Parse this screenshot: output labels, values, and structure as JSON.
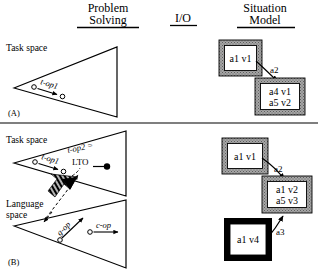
{
  "figure": {
    "divider_y": 123
  },
  "headers": [
    {
      "line1": "Problem",
      "line2": "Solving",
      "x": 108,
      "y": 12
    },
    {
      "line1": "I/O",
      "line2": "",
      "x": 183,
      "y": 22
    },
    {
      "line1": "Situation",
      "line2": "Model",
      "x": 265,
      "y": 12
    }
  ],
  "panels": [
    {
      "id": "A",
      "label": "(A)",
      "x": 8,
      "y": 113
    },
    {
      "id": "B",
      "label": "(B)",
      "x": 8,
      "y": 262
    }
  ],
  "space_labels": [
    {
      "text": "Task space",
      "x": 6,
      "y": 48,
      "panel": "A"
    },
    {
      "text": "Task space",
      "x": 6,
      "y": 140,
      "panel": "B"
    },
    {
      "text": "Language",
      "x": 6,
      "y": 204,
      "panel": "B"
    },
    {
      "text": "space",
      "x": 6,
      "y": 215,
      "panel": "B"
    }
  ],
  "operators": [
    {
      "id": "t-op1-a",
      "text": "t-op1",
      "panel": "A",
      "style": "italic-rotated"
    },
    {
      "id": "t-op1-b",
      "text": "t-op1",
      "panel": "B",
      "style": "italic-rotated"
    },
    {
      "id": "t-op2",
      "text": "t-op2 =",
      "panel": "B",
      "style": "italic-rotated"
    },
    {
      "id": "lto",
      "text": "LTO",
      "panel": "B",
      "style": "upright"
    },
    {
      "id": "g-op",
      "text": "g-op",
      "panel": "B",
      "style": "italic-rotated"
    },
    {
      "id": "c-op",
      "text": "c-op",
      "panel": "B",
      "style": "italic"
    }
  ],
  "situation_model": {
    "panel_A": {
      "nodes": [
        {
          "id": "nA1",
          "lines": [
            "a1 v1"
          ],
          "border": "gray",
          "x": 219,
          "y": 40,
          "w": 43,
          "h": 36
        },
        {
          "id": "nA2",
          "lines": [
            "a4 v1",
            "a5 v2"
          ],
          "border": "gray",
          "x": 255,
          "y": 78,
          "w": 50,
          "h": 37
        }
      ],
      "arcs": [
        {
          "id": "arcA2",
          "label": "a2",
          "from": "nA1",
          "to": "nA2",
          "lx": 270,
          "ly": 73
        }
      ]
    },
    "panel_B": {
      "nodes": [
        {
          "id": "nB1",
          "lines": [
            "a1 v1"
          ],
          "border": "gray",
          "x": 222,
          "y": 138,
          "w": 46,
          "h": 36
        },
        {
          "id": "nB2",
          "lines": [
            "a1 v2",
            "a5 v3"
          ],
          "border": "gray",
          "x": 262,
          "y": 176,
          "w": 50,
          "h": 37
        },
        {
          "id": "nB3",
          "lines": [
            "a1 v4"
          ],
          "border": "black",
          "x": 224,
          "y": 218,
          "w": 48,
          "h": 43
        }
      ],
      "arcs": [
        {
          "id": "arcB2",
          "label": "a2",
          "from": "nB1",
          "to": "nB2",
          "lx": 274,
          "ly": 169
        },
        {
          "id": "arcB3",
          "label": "a3",
          "from": "nB3",
          "to": "nB2",
          "lx": 276,
          "ly": 232
        }
      ]
    }
  },
  "colors": {
    "ink": "#000000",
    "border_gray": "#9a9a9a",
    "paper": "#ffffff"
  }
}
